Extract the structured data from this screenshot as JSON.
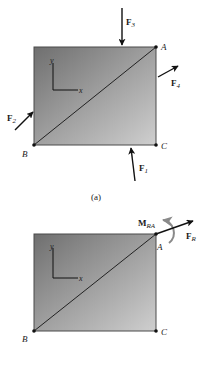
{
  "figure": {
    "caption_a": "(a)",
    "colors": {
      "plate_dark": "#7a7a7a",
      "plate_light": "#c9c9c9",
      "edge": "#4a4a4a",
      "arrow": "#111111",
      "moment_arrow": "#8a8a8a",
      "background": "#fafafa"
    },
    "top_diagram": {
      "points": {
        "A": "A",
        "B": "B",
        "C": "C"
      },
      "axes": {
        "x": "x",
        "y": "y"
      },
      "forces": [
        {
          "id": "F1",
          "symbol": "F",
          "subscript": "1"
        },
        {
          "id": "F2",
          "symbol": "F",
          "subscript": "2"
        },
        {
          "id": "F3",
          "symbol": "F",
          "subscript": "3"
        },
        {
          "id": "F4",
          "symbol": "F",
          "subscript": "4"
        }
      ]
    },
    "bottom_diagram": {
      "points": {
        "A": "A",
        "B": "B",
        "C": "C"
      },
      "axes": {
        "x": "x",
        "y": "y"
      },
      "resultant_force": {
        "symbol": "F",
        "subscript": "R"
      },
      "resultant_moment": {
        "symbol": "M",
        "subscript": "RA"
      }
    }
  }
}
